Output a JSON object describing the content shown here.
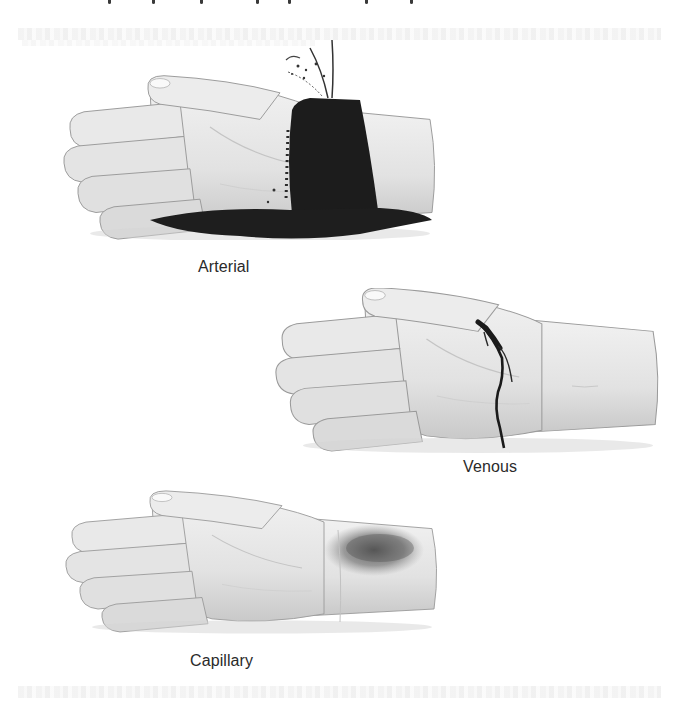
{
  "figure": {
    "panels": [
      {
        "id": "arterial",
        "label": "Arterial",
        "bleeding_type": "arterial"
      },
      {
        "id": "venous",
        "label": "Venous",
        "bleeding_type": "venous"
      },
      {
        "id": "capillary",
        "label": "Capillary",
        "bleeding_type": "capillary"
      }
    ]
  },
  "colors": {
    "background": "#ffffff",
    "skin": "#e6e6e6",
    "skin_shadow": "#bdbdbd",
    "outline": "#8a8a8a",
    "blood": "#1e1e1e",
    "caption": "#2a2a2a"
  }
}
